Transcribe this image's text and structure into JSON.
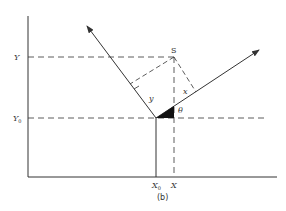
{
  "diagram": {
    "caption": "(b)",
    "labels": {
      "y_axis_upper": "Y",
      "y_axis_lower": "Y",
      "y_axis_lower_sub": "0",
      "x_axis_left": "X",
      "x_axis_left_sub": "0",
      "x_axis_right": "X",
      "point_s": "S",
      "segment_x": "x",
      "segment_y": "y",
      "angle": "θ"
    },
    "colors": {
      "stroke": "#333333",
      "background": "#ffffff"
    },
    "geometry": {
      "y_axis": {
        "x": 28,
        "y_top": 16,
        "y_bottom": 177
      },
      "x_axis": {
        "y": 177,
        "x_left": 28,
        "x_right": 277
      },
      "origin": {
        "x": 156,
        "y": 118
      },
      "point_s": {
        "x": 174,
        "y": 57
      },
      "left_arrow_tip": {
        "x": 87,
        "y": 26
      },
      "right_arrow_tip": {
        "x": 259,
        "y": 50
      }
    }
  }
}
